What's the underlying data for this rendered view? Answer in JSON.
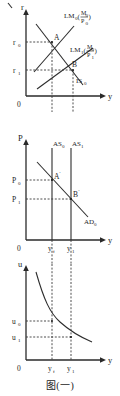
{
  "figure": {
    "caption": "图(一)",
    "panels": [
      {
        "id": "is-lm",
        "y_axis_label": "r",
        "x_axis_label": "y",
        "origin_label": "0",
        "y_ticks": [
          "r",
          "r"
        ],
        "y_tick_subs": [
          "0",
          "1"
        ],
        "curves": [
          {
            "name": "LM0",
            "label_main": "LM",
            "label_sub": "0",
            "paren_open": "(",
            "paren_close": ")",
            "num": "M",
            "num_sub": "0",
            "den": "P",
            "den_sub": "0"
          },
          {
            "name": "LM1",
            "label_main": "LM",
            "label_sub": "1",
            "paren_open": "(",
            "paren_close": ")",
            "num": "M",
            "num_sub": "0",
            "den": "P",
            "den_sub": "1"
          },
          {
            "name": "IS0",
            "label_main": "IS",
            "label_sub": "0"
          }
        ],
        "points": [
          {
            "label": "A"
          },
          {
            "label": "B"
          }
        ]
      },
      {
        "id": "ad-as",
        "y_axis_label": "P",
        "x_axis_label": "y",
        "origin_label": "0",
        "y_ticks": [
          "P",
          "P"
        ],
        "y_tick_subs": [
          "0",
          "1"
        ],
        "x_ticks": [
          "y",
          "y"
        ],
        "x_tick_subs": [
          "f",
          "1"
        ],
        "curves": [
          {
            "name": "AS0",
            "label_main": "AS",
            "label_sub": "0"
          },
          {
            "name": "AS1",
            "label_main": "AS",
            "label_sub": "1"
          },
          {
            "name": "AD0",
            "label_main": "AD",
            "label_sub": "0"
          }
        ],
        "points": [
          {
            "label": "A",
            "prime": "'"
          },
          {
            "label": "B",
            "prime": "'"
          }
        ]
      },
      {
        "id": "okun",
        "y_axis_label": "u",
        "x_axis_label": "y",
        "origin_label": "0",
        "y_ticks": [
          "u",
          "u"
        ],
        "y_tick_subs": [
          "0",
          "1"
        ],
        "x_ticks": [
          "y",
          "y"
        ],
        "x_tick_subs": [
          "f",
          "1"
        ]
      }
    ]
  },
  "colors": {
    "ink": "#1d1d1d",
    "axis": "#2a2a2a",
    "curve": "#2d2d2d",
    "dash": "#3a3a3a",
    "background": "#ffffff"
  }
}
